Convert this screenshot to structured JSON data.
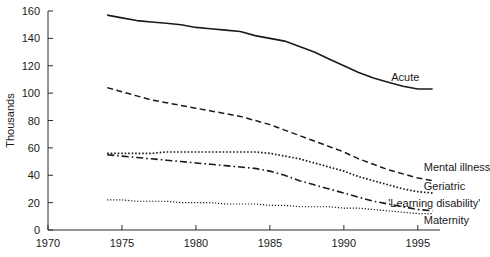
{
  "chart_data": {
    "type": "line",
    "title": "",
    "subtitle": "",
    "xlabel": "",
    "ylabel": "Thousands",
    "xlim": [
      1970,
      1996.5
    ],
    "ylim": [
      0,
      160
    ],
    "grid": false,
    "legend_position": "inline-right-of-line-ends",
    "x_ticks": [
      1970,
      1975,
      1980,
      1985,
      1990,
      1995
    ],
    "x_tick_labels": [
      "1970",
      "1975",
      "1980",
      "1985",
      "1990",
      "1995"
    ],
    "y_ticks": [
      0,
      20,
      40,
      60,
      80,
      100,
      120,
      140,
      160
    ],
    "y_tick_labels": [
      "0",
      "20",
      "40",
      "60",
      "80",
      "100",
      "120",
      "140",
      "160"
    ],
    "x": [
      1974,
      1975,
      1976,
      1977,
      1978,
      1979,
      1980,
      1981,
      1982,
      1983,
      1984,
      1985,
      1986,
      1987,
      1988,
      1989,
      1990,
      1991,
      1992,
      1993,
      1994,
      1995,
      1996
    ],
    "series": [
      {
        "name": "Acute",
        "label": "Acute",
        "style": "solid",
        "color": "#1a1a1a",
        "label_x": 1993.2,
        "label_y": 112,
        "values": [
          157,
          155,
          153,
          152,
          151,
          150,
          148,
          147,
          146,
          145,
          142,
          140,
          138,
          134,
          130,
          125,
          120,
          115,
          111,
          108,
          105,
          103,
          103
        ]
      },
      {
        "name": "Mental illness",
        "label": "Mental illness",
        "style": "dashed",
        "color": "#1a1a1a",
        "label_x": 1995.4,
        "label_y": 46,
        "values": [
          104,
          101,
          98,
          95,
          93,
          91,
          89,
          87,
          85,
          83,
          80,
          77,
          73,
          69,
          65,
          61,
          57,
          52,
          48,
          44,
          41,
          38,
          36
        ]
      },
      {
        "name": "Geriatric",
        "label": "Geriatric",
        "style": "dotted",
        "color": "#1a1a1a",
        "label_x": 1995.4,
        "label_y": 32,
        "values": [
          56,
          56,
          56,
          56,
          57,
          57,
          57,
          57,
          57,
          57,
          57,
          56,
          54,
          52,
          49,
          46,
          43,
          39,
          36,
          33,
          30,
          28,
          27
        ]
      },
      {
        "name": "'Learning disability'",
        "label": "'Learning disability'",
        "style": "dash-dot",
        "color": "#1a1a1a",
        "label_x": 1993.0,
        "label_y": 20,
        "values": [
          55,
          54,
          53,
          52,
          51,
          50,
          49,
          48,
          47,
          46,
          45,
          43,
          40,
          36,
          33,
          30,
          27,
          24,
          21,
          19,
          17,
          15,
          14
        ]
      },
      {
        "name": "Maternity",
        "label": "Maternity",
        "style": "fine-dotted",
        "color": "#1a1a1a",
        "label_x": 1995.4,
        "label_y": 7,
        "values": [
          22,
          22,
          21,
          21,
          21,
          20,
          20,
          20,
          19,
          19,
          19,
          18,
          18,
          17,
          17,
          17,
          16,
          16,
          15,
          14,
          13,
          12,
          12
        ]
      }
    ]
  },
  "axis": {
    "y_title": "Thousands"
  }
}
